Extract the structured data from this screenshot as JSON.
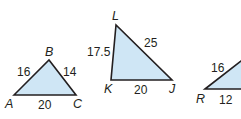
{
  "figure": {
    "type": "similar-triangles",
    "fill_color": "#cfe6f5",
    "stroke_color": "#231f20",
    "triangles": [
      {
        "name": "ABC",
        "vertices": {
          "A": "A",
          "B": "B",
          "C": "C"
        },
        "sides": {
          "AB": "16",
          "BC": "14",
          "AC": "20"
        }
      },
      {
        "name": "LKJ",
        "vertices": {
          "L": "L",
          "K": "K",
          "J": "J"
        },
        "sides": {
          "KL": "17.5",
          "LJ": "25",
          "KJ": "20"
        }
      },
      {
        "name": "R-partial",
        "vertices": {
          "R": "R"
        },
        "sides": {
          "R_upper": "16",
          "R_base": "12"
        }
      }
    ]
  }
}
